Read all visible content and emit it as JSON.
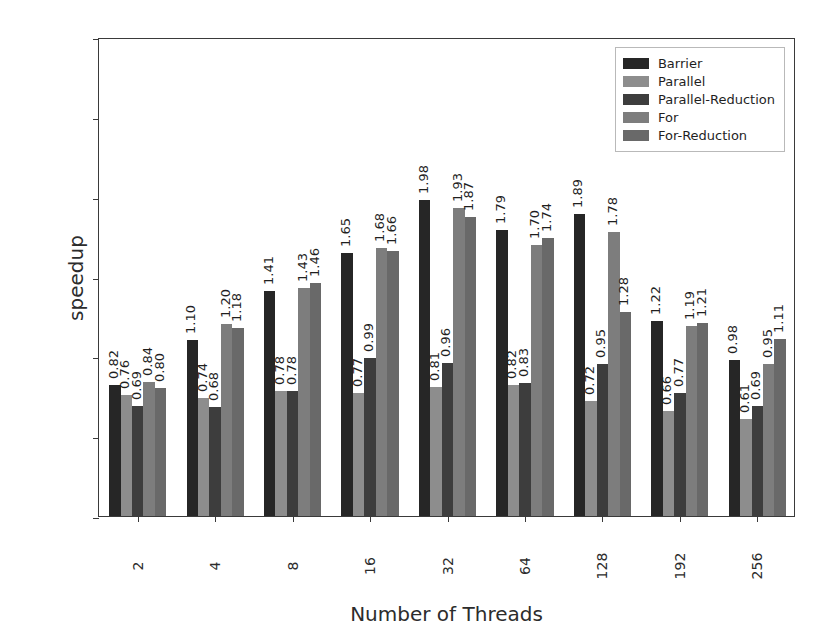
{
  "chart_data": {
    "type": "bar",
    "title": "",
    "subtitle": "",
    "xlabel": "Number of Threads",
    "ylabel": "speedup",
    "categories": [
      "2",
      "4",
      "8",
      "16",
      "32",
      "64",
      "128",
      "192",
      "256"
    ],
    "ylim": [
      0.0,
      3.0
    ],
    "yticks": [
      "0.0",
      "0.5",
      "1.0",
      "1.5",
      "2.0",
      "2.5",
      "3.0"
    ],
    "ytick_values": [
      0.0,
      0.5,
      1.0,
      1.5,
      2.0,
      2.5,
      3.0
    ],
    "grid": false,
    "legend_position": "upper right",
    "bar_value_labels": true,
    "bar_value_label_rotation": 90,
    "series": [
      {
        "name": "Barrier",
        "color": "#262626",
        "values": [
          0.82,
          1.1,
          1.41,
          1.65,
          1.98,
          1.79,
          1.89,
          1.22,
          0.98
        ],
        "labels": [
          "0.82",
          "1.10",
          "1.41",
          "1.65",
          "1.98",
          "1.79",
          "1.89",
          "1.22",
          "0.98"
        ]
      },
      {
        "name": "Parallel",
        "color": "#8d8d8d",
        "values": [
          0.76,
          0.74,
          0.78,
          0.77,
          0.81,
          0.82,
          0.72,
          0.66,
          0.61
        ],
        "labels": [
          "0.76",
          "0.74",
          "0.78",
          "0.77",
          "0.81",
          "0.82",
          "0.72",
          "0.66",
          "0.61"
        ]
      },
      {
        "name": "Parallel-Reduction",
        "color": "#3d3d3d",
        "values": [
          0.69,
          0.68,
          0.78,
          0.99,
          0.96,
          0.83,
          0.95,
          0.77,
          0.69
        ],
        "labels": [
          "0.69",
          "0.68",
          "0.78",
          "0.99",
          "0.96",
          "0.83",
          "0.95",
          "0.77",
          "0.69"
        ]
      },
      {
        "name": "For",
        "color": "#7d7d7d",
        "values": [
          0.84,
          1.2,
          1.43,
          1.68,
          1.93,
          1.7,
          1.78,
          1.19,
          0.95
        ],
        "labels": [
          "0.84",
          "1.20",
          "1.43",
          "1.68",
          "1.93",
          "1.70",
          "1.78",
          "1.19",
          "0.95"
        ]
      },
      {
        "name": "For-Reduction",
        "color": "#696969",
        "values": [
          0.8,
          1.18,
          1.46,
          1.66,
          1.87,
          1.74,
          1.28,
          1.21,
          1.11
        ],
        "labels": [
          "0.80",
          "1.18",
          "1.46",
          "1.66",
          "1.87",
          "1.74",
          "1.28",
          "1.21",
          "1.11"
        ]
      }
    ]
  },
  "axes": {
    "y_title": "speedup",
    "x_title": "Number of Threads"
  }
}
